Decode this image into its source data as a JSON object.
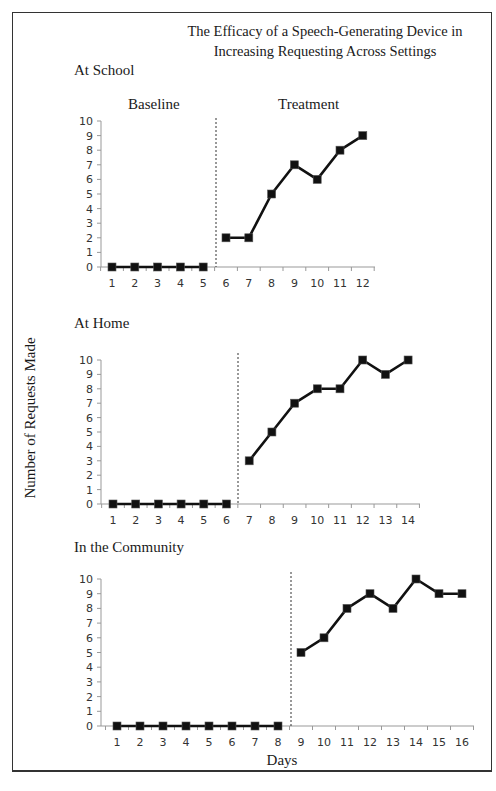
{
  "title_line1": "The Efficacy of a Speech-Generating Device in",
  "title_line2": "Increasing Requesting Across Settings",
  "y_axis_label": "Number of Requests Made",
  "x_axis_label": "Days",
  "phase_labels": {
    "baseline": "Baseline",
    "treatment": "Treatment"
  },
  "panels": [
    {
      "label": "At School"
    },
    {
      "label": "At Home"
    },
    {
      "label": "In the Community"
    }
  ],
  "chart_data": [
    {
      "type": "line",
      "title": "At School",
      "xlabel": "Days",
      "ylabel": "Number of Requests Made",
      "ylim": [
        0,
        10
      ],
      "yticks": [
        0,
        1,
        2,
        3,
        4,
        5,
        6,
        7,
        8,
        9,
        10
      ],
      "categories": [
        1,
        2,
        3,
        4,
        5,
        6,
        7,
        8,
        9,
        10,
        11,
        12
      ],
      "phase_change_after": 5,
      "series": [
        {
          "name": "Baseline",
          "x": [
            1,
            2,
            3,
            4,
            5
          ],
          "values": [
            0,
            0,
            0,
            0,
            0
          ]
        },
        {
          "name": "Treatment",
          "x": [
            6,
            7,
            8,
            9,
            10,
            11,
            12
          ],
          "values": [
            2,
            2,
            5,
            7,
            6,
            8,
            9
          ]
        }
      ],
      "grid": false,
      "marker": "square"
    },
    {
      "type": "line",
      "title": "At Home",
      "xlabel": "Days",
      "ylabel": "Number of Requests Made",
      "ylim": [
        0,
        10
      ],
      "yticks": [
        0,
        1,
        2,
        3,
        4,
        5,
        6,
        7,
        8,
        9,
        10
      ],
      "categories": [
        1,
        2,
        3,
        4,
        5,
        6,
        7,
        8,
        9,
        10,
        11,
        12,
        13,
        14
      ],
      "phase_change_after": 6,
      "series": [
        {
          "name": "Baseline",
          "x": [
            1,
            2,
            3,
            4,
            5,
            6
          ],
          "values": [
            0,
            0,
            0,
            0,
            0,
            0
          ]
        },
        {
          "name": "Treatment",
          "x": [
            7,
            8,
            9,
            10,
            11,
            12,
            13,
            14
          ],
          "values": [
            3,
            5,
            7,
            8,
            8,
            10,
            9,
            10
          ]
        }
      ],
      "grid": false,
      "marker": "square"
    },
    {
      "type": "line",
      "title": "In the Community",
      "xlabel": "Days",
      "ylabel": "Number of Requests Made",
      "ylim": [
        0,
        10
      ],
      "yticks": [
        0,
        1,
        2,
        3,
        4,
        5,
        6,
        7,
        8,
        9,
        10
      ],
      "categories": [
        1,
        2,
        3,
        4,
        5,
        6,
        7,
        8,
        9,
        10,
        11,
        12,
        13,
        14,
        15,
        16
      ],
      "phase_change_after": 8,
      "series": [
        {
          "name": "Baseline",
          "x": [
            1,
            2,
            3,
            4,
            5,
            6,
            7,
            8
          ],
          "values": [
            0,
            0,
            0,
            0,
            0,
            0,
            0,
            0
          ]
        },
        {
          "name": "Treatment",
          "x": [
            9,
            10,
            11,
            12,
            13,
            14,
            15,
            16
          ],
          "values": [
            5,
            6,
            8,
            9,
            8,
            10,
            9,
            9
          ]
        }
      ],
      "grid": false,
      "marker": "square"
    }
  ],
  "layout": {
    "panels": [
      {
        "axisX": 101,
        "y0": 267,
        "y10": 121,
        "x1": 112,
        "dx": 22.8,
        "axisEnd": 375,
        "dashX": 216,
        "dashTop": 118,
        "labelTop": 43
      },
      {
        "axisX": 101,
        "y0": 504,
        "y10": 360,
        "x1": 113,
        "dx": 22.7,
        "axisEnd": 420,
        "dashX": 238,
        "dashTop": 353,
        "labelTop": 311
      },
      {
        "axisX": 101,
        "y0": 726,
        "y10": 579,
        "x1": 117,
        "dx": 23.0,
        "axisEnd": 474,
        "dashX": 291,
        "dashTop": 572,
        "labelTop": 536
      }
    ]
  }
}
